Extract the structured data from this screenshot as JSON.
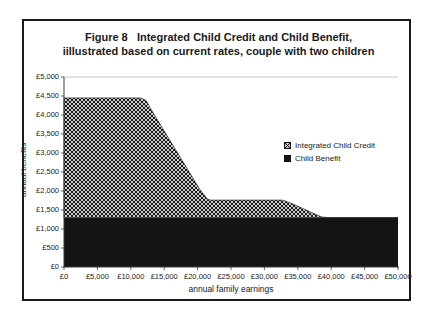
{
  "figure": {
    "title_line1": "Figure 8   Integrated Child Credit and Child Benefit,",
    "title_line2": "iillustrated based on current rates, couple with two children"
  },
  "axes": {
    "y_title": "annaul benefits",
    "x_title": "annual family earnings",
    "y_tick_labels_top_down": [
      "£5,000",
      "£4,500",
      "£4,000",
      "£3,500",
      "£3,000",
      "£2,500",
      "£2,000",
      "£1,500",
      "£1,000",
      "£500",
      "£0"
    ],
    "x_tick_labels": [
      "£0",
      "£5,000",
      "£10,000",
      "£15,000",
      "£20,000",
      "£25,000",
      "£30,000",
      "£35,000",
      "£40,000",
      "£45,000",
      "£50,000"
    ]
  },
  "legend": {
    "items": [
      {
        "label": "Integrated Child Credit",
        "swatch": "crosshatch"
      },
      {
        "label": "Child Benefit",
        "swatch": "solid-black"
      }
    ]
  },
  "colors": {
    "area_black": "#141414",
    "pattern_bg": "#cccccc",
    "pattern_fg": "#1a1a1a",
    "axis": "#3a3a3a",
    "gridline": "#b8b8b8",
    "figure_border": "#1a1a1a"
  },
  "chart_data": {
    "type": "area",
    "stacked": true,
    "xlabel": "annual family earnings",
    "ylabel": "annaul benefits",
    "xlim": [
      0,
      50000
    ],
    "ylim": [
      0,
      5000
    ],
    "x_tick_step": 5000,
    "y_tick_step": 500,
    "grid": "top boundary line at £5,000 only",
    "legend_position": "middle-right inside plot",
    "series": [
      {
        "name": "Child Benefit",
        "fill": "solid-black",
        "points": [
          [
            0,
            1300
          ],
          [
            50000,
            1300
          ]
        ],
        "note": "constant annual child benefit across all earnings"
      },
      {
        "name": "Integrated Child Credit",
        "fill": "gray-crosshatch-pattern",
        "stacked_on": "Child Benefit",
        "points": [
          [
            0,
            3150
          ],
          [
            11500,
            3150
          ],
          [
            12300,
            3080
          ],
          [
            13200,
            2800
          ],
          [
            20300,
            750
          ],
          [
            21500,
            480
          ],
          [
            22000,
            460
          ],
          [
            32700,
            460
          ],
          [
            34000,
            380
          ],
          [
            38500,
            20
          ],
          [
            39500,
            0
          ],
          [
            50000,
            0
          ]
        ],
        "note": "max ~£3,150 (total ~£4,450) flat to ~£11,500, tapers to ~£460 (total ~£1,760) by ~£21,500, flat to ~£33,000, tapers to zero by ~£39,500"
      }
    ]
  }
}
